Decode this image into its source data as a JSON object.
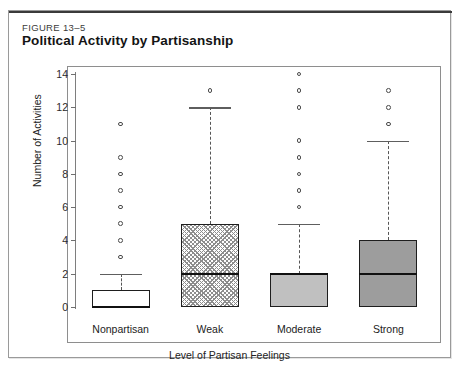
{
  "figure": {
    "number": "FIGURE 13–5",
    "title": "Political Activity by Partisanship"
  },
  "chart_data": {
    "type": "box",
    "title": "Political Activity by Partisanship",
    "xlabel": "Level of Partisan Feelings",
    "ylabel": "Number of Activities",
    "ylim": [
      0,
      14
    ],
    "yticks": [
      0,
      2,
      4,
      6,
      8,
      10,
      12,
      14
    ],
    "grid": false,
    "legend": "none",
    "categories": [
      "Nonpartisan",
      "Weak",
      "Moderate",
      "Strong"
    ],
    "boxes": [
      {
        "category": "Nonpartisan",
        "q1": 0,
        "median": 0,
        "q3": 1,
        "whisker_low": 0,
        "whisker_high": 2,
        "fill": "none",
        "fill_color": "#ffffff",
        "outliers": [
          3,
          4,
          5,
          6,
          7,
          8,
          9,
          11
        ]
      },
      {
        "category": "Weak",
        "q1": 0,
        "median": 2,
        "q3": 5,
        "whisker_low": 0,
        "whisker_high": 12,
        "fill": "hatch",
        "fill_color": "#8d8d8d",
        "outliers": [
          13
        ]
      },
      {
        "category": "Moderate",
        "q1": 0,
        "median": 2,
        "q3": 2,
        "whisker_low": 0,
        "whisker_high": 5,
        "fill": "light",
        "fill_color": "#c0c0c0",
        "outliers": [
          6,
          7,
          8,
          9,
          10,
          12,
          13,
          14
        ]
      },
      {
        "category": "Strong",
        "q1": 0,
        "median": 2,
        "q3": 4,
        "whisker_low": 0,
        "whisker_high": 10,
        "fill": "dark",
        "fill_color": "#9d9d9d",
        "outliers": [
          11,
          12,
          13
        ]
      }
    ]
  }
}
